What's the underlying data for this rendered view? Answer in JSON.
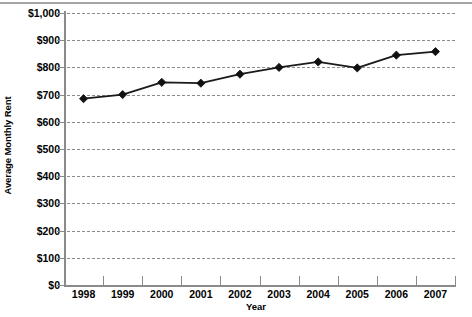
{
  "chart_data": {
    "type": "line",
    "title": "",
    "xlabel": "Year",
    "ylabel": "Average Monthly Rent",
    "categories": [
      "1998",
      "1999",
      "2000",
      "2001",
      "2002",
      "2003",
      "2004",
      "2005",
      "2006",
      "2007"
    ],
    "x": [
      1998,
      1999,
      2000,
      2001,
      2002,
      2003,
      2004,
      2005,
      2006,
      2007
    ],
    "values": [
      685,
      700,
      745,
      742,
      775,
      800,
      820,
      798,
      845,
      858
    ],
    "series": [
      {
        "name": "Average Monthly Rent",
        "values": [
          685,
          700,
          745,
          742,
          775,
          800,
          820,
          798,
          845,
          858
        ]
      }
    ],
    "ylim": [
      0,
      1000
    ],
    "ytick_values": [
      0,
      100,
      200,
      300,
      400,
      500,
      600,
      700,
      800,
      900,
      1000
    ],
    "ytick_labels": [
      "$0",
      "$100",
      "$200",
      "$300",
      "$400",
      "$500",
      "$600",
      "$700",
      "$800",
      "$900",
      "$1,000"
    ],
    "xtick_labels": [
      "1998",
      "1999",
      "2000",
      "2001",
      "2002",
      "2003",
      "2004",
      "2005",
      "2006",
      "2007"
    ],
    "grid": "horizontal-dashed",
    "legend": "none",
    "marker": "diamond",
    "line_color": "#1a1a1a",
    "marker_color": "#111111",
    "grid_color": "#8c8c8c",
    "axis_color": "#8a8a8a"
  },
  "axes": {
    "ylabel_text": "Average Monthly Rent",
    "xlabel_text": "Year"
  }
}
